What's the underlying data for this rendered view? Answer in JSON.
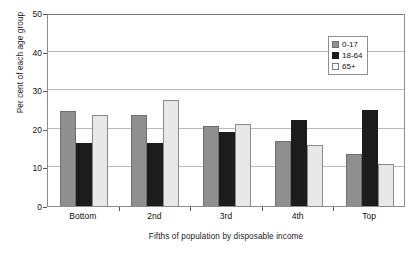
{
  "chart_data": {
    "type": "bar",
    "title": "",
    "xlabel": "Fifths of population by disposable income",
    "ylabel": "Per cent of each age group",
    "categories": [
      "Bottom",
      "2nd",
      "3rd",
      "4th",
      "Top"
    ],
    "series": [
      {
        "name": "0-17",
        "color": "#8f8f8f",
        "values": [
          24.7,
          23.5,
          20.6,
          16.8,
          13.5
        ]
      },
      {
        "name": "18-64",
        "color": "#1c1c1c",
        "values": [
          16.2,
          16.3,
          19.3,
          22.2,
          25.0
        ]
      },
      {
        "name": "65+",
        "color": "#ffffff",
        "values": [
          23.6,
          27.5,
          21.3,
          15.9,
          11.0
        ]
      }
    ],
    "ylim": [
      0,
      50
    ],
    "yticks": [
      0,
      10,
      20,
      30,
      40,
      50
    ],
    "grid": true,
    "legend_position": "top-right"
  },
  "axes": {
    "y_tick_labels": [
      "0",
      "10",
      "20",
      "30",
      "40",
      "50"
    ]
  }
}
